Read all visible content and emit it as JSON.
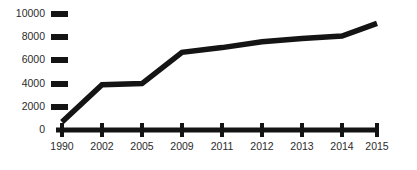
{
  "chart_data": {
    "type": "line",
    "title": "",
    "subtitle": "",
    "xlabel": "",
    "ylabel": "",
    "grid": false,
    "legend": false,
    "legend_position": "none",
    "line_color": "#141414",
    "axis_color": "#141414",
    "label_color": "#2b2b2b",
    "background_color": "#ffffff",
    "categories": [
      "1990",
      "2002",
      "2005",
      "2009",
      "2011",
      "2012",
      "2013",
      "2014",
      "2015"
    ],
    "values": [
      700,
      3900,
      4000,
      6700,
      7100,
      7600,
      7900,
      8100,
      9200
    ],
    "series": [
      {
        "name": "",
        "values": [
          700,
          3900,
          4000,
          6700,
          7100,
          7600,
          7900,
          8100,
          9200
        ]
      }
    ],
    "ylim": [
      0,
      10000
    ],
    "yticks": [
      0,
      2000,
      4000,
      6000,
      8000,
      10000
    ],
    "ytick_labels": [
      "0",
      "2000",
      "4000",
      "6000",
      "8000",
      "10000"
    ],
    "xtick_labels": [
      "1990",
      "2002",
      "2005",
      "2009",
      "2011",
      "2012",
      "2013",
      "2014",
      "2015"
    ]
  },
  "y_axis": {
    "ticks": [
      {
        "value": 10000,
        "label": "10000"
      },
      {
        "value": 8000,
        "label": "8000"
      },
      {
        "value": 6000,
        "label": "6000"
      },
      {
        "value": 4000,
        "label": "4000"
      },
      {
        "value": 2000,
        "label": "2000"
      },
      {
        "value": 0,
        "label": "0"
      }
    ]
  },
  "x_axis": {
    "ticks": [
      {
        "label": "1990"
      },
      {
        "label": "2002"
      },
      {
        "label": "2005"
      },
      {
        "label": "2009"
      },
      {
        "label": "2011"
      },
      {
        "label": "2012"
      },
      {
        "label": "2013"
      },
      {
        "label": "2014"
      },
      {
        "label": "2015"
      }
    ]
  }
}
